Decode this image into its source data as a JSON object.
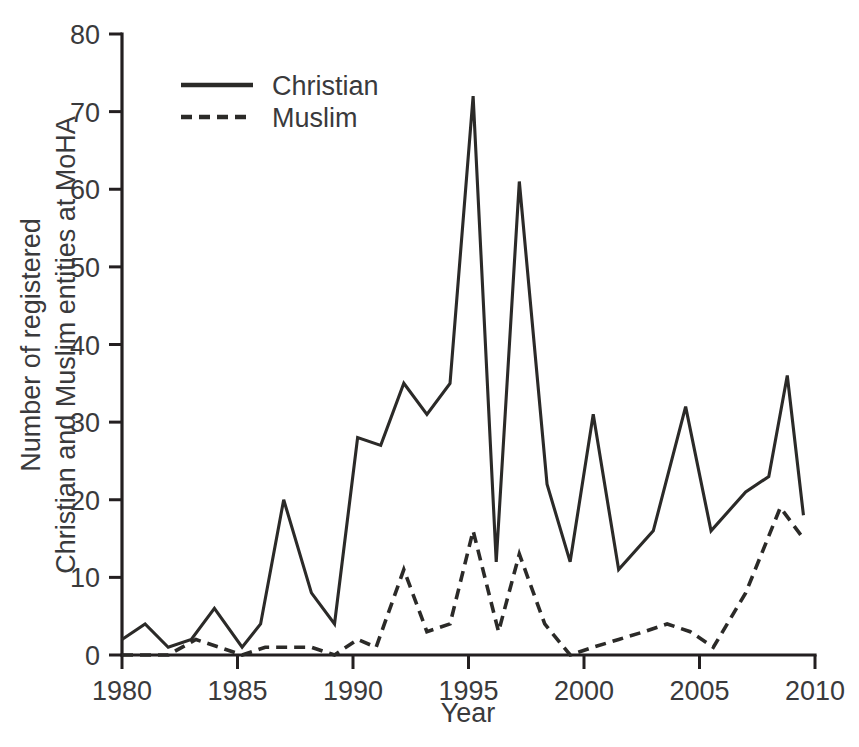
{
  "chart_data": {
    "type": "line",
    "title": "",
    "xlabel": "Year",
    "ylabel": "Number of registered\nChristian and Muslim entities at MoHA",
    "ylabel_line1": "Number of registered",
    "ylabel_line2": "Christian and Muslim entities at MoHA",
    "xlim": [
      1980,
      2010
    ],
    "ylim": [
      0,
      80
    ],
    "xticks": [
      1980,
      1985,
      1990,
      1995,
      2000,
      2005,
      2010
    ],
    "xtick_labels": [
      "1980",
      "1985",
      "1990",
      "1995",
      "2000",
      "2005",
      "2010"
    ],
    "yticks": [
      0,
      10,
      20,
      30,
      40,
      50,
      60,
      70,
      80
    ],
    "ytick_labels": [
      "0",
      "10",
      "20",
      "30",
      "40",
      "50",
      "60",
      "70",
      "80"
    ],
    "grid": false,
    "legend_position": "upper-left-inside",
    "line_color": "#2b2a28",
    "series": [
      {
        "name": "Christian",
        "style": "solid",
        "x": [
          1980.0,
          1981.0,
          1982.0,
          1983.0,
          1984.0,
          1985.2,
          1986.0,
          1987.0,
          1988.2,
          1989.2,
          1990.2,
          1991.2,
          1992.2,
          1993.2,
          1994.2,
          1995.2,
          1996.2,
          1997.2,
          1998.4,
          1999.4,
          2000.4,
          2001.5,
          2003.0,
          2004.4,
          2005.5,
          2007.0,
          2008.0,
          2008.8,
          2009.5
        ],
        "y": [
          2,
          4,
          1,
          2,
          6,
          1,
          4,
          20,
          8,
          4,
          28,
          27,
          35,
          31,
          35,
          72,
          12,
          61,
          22,
          12,
          31,
          11,
          16,
          32,
          16,
          21,
          23,
          36,
          18
        ]
      },
      {
        "name": "Muslim",
        "style": "dashed",
        "x": [
          1980.0,
          1981.0,
          1982.0,
          1983.2,
          1984.2,
          1985.2,
          1986.2,
          1987.2,
          1988.2,
          1989.2,
          1990.2,
          1991.0,
          1992.2,
          1993.2,
          1994.2,
          1995.2,
          1996.3,
          1997.2,
          1998.3,
          1999.4,
          2000.4,
          2001.5,
          2002.6,
          2003.6,
          2004.6,
          2005.6,
          2007.0,
          2008.5,
          2009.5
        ],
        "y": [
          0,
          0,
          0,
          2,
          1,
          0,
          1,
          1,
          1,
          0,
          2,
          1,
          11,
          3,
          4,
          16,
          3,
          13,
          4,
          0,
          1,
          2,
          3,
          4,
          3,
          1,
          8,
          19,
          15
        ]
      }
    ],
    "legend": [
      {
        "label": "Christian",
        "style": "solid"
      },
      {
        "label": "Muslim",
        "style": "dashed"
      }
    ]
  }
}
